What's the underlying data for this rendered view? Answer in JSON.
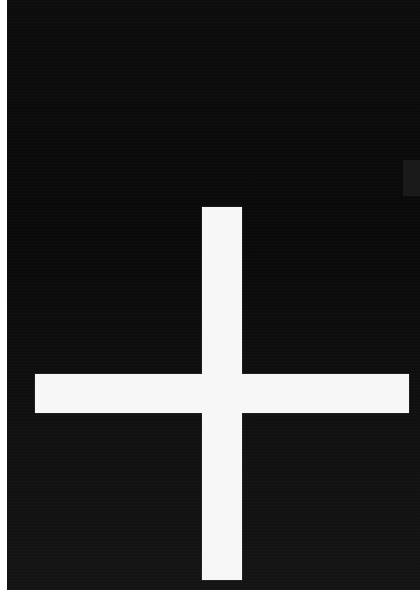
{
  "image": {
    "subject": "white cross on black background",
    "colors": {
      "background": "#0d0d0d",
      "cross": "#f7f7f7",
      "border": "#ffffff"
    },
    "icon": "plus-cross-icon"
  }
}
